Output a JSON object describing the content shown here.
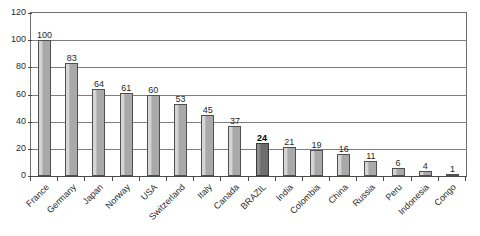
{
  "chart_data": {
    "type": "bar",
    "title": "",
    "subtitle": "",
    "xlabel": "",
    "ylabel": "",
    "ylim": [
      0,
      120
    ],
    "ytick_step": 20,
    "yticks": [
      0,
      20,
      40,
      60,
      80,
      100,
      120
    ],
    "grid": true,
    "legend": "none",
    "categories": [
      "France",
      "Germany",
      "Japan",
      "Norway",
      "USA",
      "Switzerland",
      "Italy",
      "Canada",
      "BRAZIL",
      "India",
      "Colombia",
      "China",
      "Russia",
      "Peru",
      "Indonesia",
      "Congo"
    ],
    "values": [
      100,
      83,
      64,
      61,
      60,
      53,
      45,
      37,
      24,
      21,
      19,
      16,
      11,
      6,
      4,
      1
    ],
    "highlight_index": 8,
    "highlight_category": "BRAZIL",
    "bar_color": "#a9a9a9",
    "bar_highlight_color": "#6e6e6e",
    "bar_border_color": "#4f4f4f",
    "axis_color": "#4a4a4a",
    "gridline_color": "#7d7d7d",
    "label_color": "#2b2b2b"
  }
}
